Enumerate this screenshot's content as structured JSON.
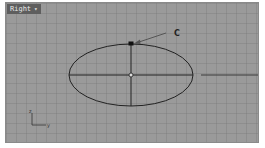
{
  "viewport": {
    "name": "Right",
    "dropdown_icon": "chevron-down-icon",
    "background": "#9a9a9a"
  },
  "annotation": {
    "label": "C"
  },
  "axes_icon": {
    "x_label": "y",
    "y_label": "z"
  },
  "ellipse": {
    "cx": 125,
    "cy": 72,
    "rx": 62,
    "ry": 31,
    "stroke": "#222222"
  }
}
